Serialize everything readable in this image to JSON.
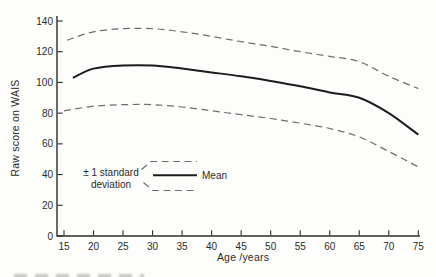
{
  "chart_data": {
    "type": "line",
    "title": "",
    "xlabel": "Age /years",
    "ylabel": "Raw score on WAIS",
    "xlim": [
      15,
      75
    ],
    "ylim": [
      0,
      140
    ],
    "xticks": [
      15,
      20,
      25,
      30,
      35,
      40,
      45,
      50,
      55,
      60,
      65,
      70,
      75
    ],
    "yticks": [
      0,
      20,
      40,
      60,
      80,
      100,
      120,
      140
    ],
    "grid": false,
    "legend": {
      "deviation_line1": "± 1 standard",
      "deviation_line2": "deviation",
      "mean": "Mean",
      "position": "inside-lower-left"
    },
    "colors": {
      "mean_line": "#1c1c1c",
      "deviation_line": "#6e6e6e",
      "axis": "#2b2b2b",
      "text": "#2b2b2b",
      "background": "#fdfdfb"
    },
    "series": [
      {
        "id": "upper-sd",
        "name": "+1 standard deviation",
        "style": "dashed",
        "points": [
          [
            15.5,
            127.5
          ],
          [
            20,
            133
          ],
          [
            25,
            135
          ],
          [
            30,
            135
          ],
          [
            35,
            133
          ],
          [
            40,
            130
          ],
          [
            45,
            126.5
          ],
          [
            50,
            123.5
          ],
          [
            55,
            120
          ],
          [
            60,
            117
          ],
          [
            65,
            113.5
          ],
          [
            70,
            104
          ],
          [
            75,
            96
          ]
        ]
      },
      {
        "id": "mean",
        "name": "Mean",
        "style": "solid",
        "points": [
          [
            16.5,
            103
          ],
          [
            20,
            109
          ],
          [
            25,
            111
          ],
          [
            30,
            111
          ],
          [
            35,
            109
          ],
          [
            40,
            106.5
          ],
          [
            45,
            104
          ],
          [
            50,
            101
          ],
          [
            55,
            97.5
          ],
          [
            60,
            93.5
          ],
          [
            65,
            90
          ],
          [
            70,
            80
          ],
          [
            75,
            66
          ]
        ]
      },
      {
        "id": "lower-sd",
        "name": "-1 standard deviation",
        "style": "dashed",
        "points": [
          [
            15,
            81.5
          ],
          [
            20,
            84.5
          ],
          [
            25,
            85.5
          ],
          [
            30,
            85.5
          ],
          [
            35,
            84
          ],
          [
            40,
            81.5
          ],
          [
            45,
            79
          ],
          [
            50,
            76.5
          ],
          [
            55,
            73.5
          ],
          [
            60,
            70
          ],
          [
            65,
            64.5
          ],
          [
            70,
            55
          ],
          [
            75,
            45
          ]
        ]
      }
    ]
  }
}
